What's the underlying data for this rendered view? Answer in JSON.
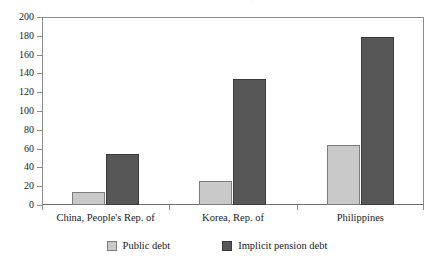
{
  "chart_data": {
    "type": "bar",
    "title": "to GDP in selected countries, 1990/2000",
    "xlabel": "",
    "ylabel": "",
    "ylim": [
      0,
      200
    ],
    "yticks": [
      0,
      20,
      40,
      60,
      80,
      100,
      120,
      140,
      160,
      180,
      200
    ],
    "ytick_labels": [
      "0",
      "20",
      "40",
      "60",
      "80",
      "100",
      "120",
      "140",
      "160",
      "180",
      "200"
    ],
    "grid": false,
    "legend_position": "bottom-center",
    "categories": [
      "China, People's Rep. of",
      "Korea, Rep. of",
      "Philippines"
    ],
    "series": [
      {
        "name": "Public debt",
        "color": "#c9c9c9",
        "values": [
          14,
          26,
          64
        ]
      },
      {
        "name": "Implicit pension debt",
        "color": "#575757",
        "values": [
          54,
          134,
          179
        ]
      }
    ]
  },
  "legend": {
    "items": [
      {
        "label": "Public debt"
      },
      {
        "label": "Implicit pension debt"
      }
    ]
  }
}
